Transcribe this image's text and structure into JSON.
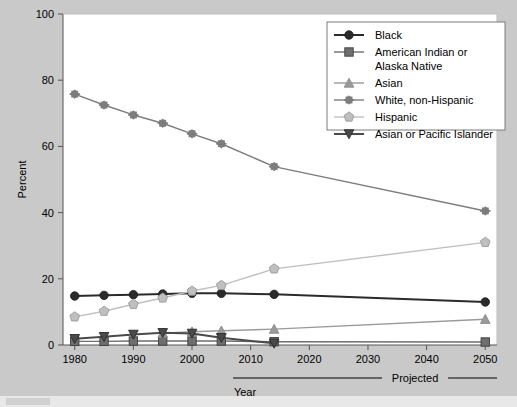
{
  "chart_data": {
    "type": "line",
    "title": "",
    "xlabel": "Year",
    "ylabel": "Percent",
    "xlim": [
      1978,
      2052
    ],
    "ylim": [
      0,
      100
    ],
    "yticks": [
      0,
      20,
      40,
      60,
      80,
      100
    ],
    "xticks": [
      1980,
      1990,
      2000,
      2010,
      2020,
      2030,
      2040,
      2050
    ],
    "xtick_labels": [
      "1980",
      "1990",
      "2000",
      "2010",
      "2020",
      "2030",
      "2040",
      "2050"
    ],
    "ytick_labels": [
      "0",
      "20",
      "40",
      "60",
      "80",
      "100"
    ],
    "grid": false,
    "legend_position": "top-right",
    "annotations": [
      {
        "text": "Projected",
        "start_x": 2007,
        "end_x": 2052
      }
    ],
    "series": [
      {
        "name": "Black",
        "color": "#2b2b2b",
        "marker": "circle",
        "x": [
          1980,
          1985,
          1990,
          1995,
          2000,
          2005,
          2014,
          2050
        ],
        "values": [
          14.8,
          15.0,
          15.2,
          15.4,
          15.6,
          15.6,
          15.3,
          13.0
        ]
      },
      {
        "name": "American Indian or Alaska Native",
        "color": "#6e6e6e",
        "marker": "square",
        "x": [
          1980,
          1985,
          1990,
          1995,
          2000,
          2005,
          2014,
          2050
        ],
        "values": [
          1.1,
          1.1,
          1.2,
          1.2,
          1.2,
          1.2,
          1.0,
          0.9
        ]
      },
      {
        "name": "Asian",
        "color": "#9a9a9a",
        "marker": "triangle-up",
        "x": [
          1995,
          2000,
          2005,
          2014,
          2050
        ],
        "values": [
          3.6,
          4.0,
          4.3,
          4.8,
          7.8
        ]
      },
      {
        "name": "White, non-Hispanic",
        "color": "#7d7d7d",
        "marker": "star-x",
        "x": [
          1980,
          1985,
          1990,
          1995,
          2000,
          2005,
          2014,
          2050
        ],
        "values": [
          75.8,
          72.5,
          69.5,
          67.0,
          63.8,
          60.8,
          53.9,
          40.5
        ]
      },
      {
        "name": "Hispanic",
        "color": "#bfbfbf",
        "marker": "pentagon",
        "x": [
          1980,
          1985,
          1990,
          1995,
          2000,
          2005,
          2014,
          2050
        ],
        "values": [
          8.5,
          10.2,
          12.3,
          14.2,
          16.3,
          18.0,
          23.0,
          31.0
        ]
      },
      {
        "name": "Asian or Pacific Islander",
        "color": "#4a4a4a",
        "marker": "triangle-down",
        "x": [
          1980,
          1985,
          1990,
          1995,
          2000,
          2005,
          2014
        ],
        "values": [
          1.9,
          2.5,
          3.2,
          3.7,
          3.5,
          2.2,
          0.5
        ]
      }
    ]
  },
  "legend": {
    "entries": [
      {
        "label": "Black",
        "marker": "circle",
        "color": "#2b2b2b"
      },
      {
        "label": "American Indian or",
        "label2": "Alaska Native",
        "marker": "square",
        "color": "#6e6e6e"
      },
      {
        "label": "Asian",
        "marker": "triangle-up",
        "color": "#9a9a9a"
      },
      {
        "label": "White, non-Hispanic",
        "marker": "star-x",
        "color": "#7d7d7d"
      },
      {
        "label": "Hispanic",
        "marker": "pentagon",
        "color": "#bfbfbf"
      },
      {
        "label": "Asian or Pacific Islander",
        "marker": "triangle-down",
        "color": "#4a4a4a"
      }
    ]
  },
  "axes": {
    "ylabel": "Percent",
    "xlabel": "Year",
    "projected_label": "Projected"
  },
  "colors": {
    "background": "#c9c9c9",
    "plot_background": "#ffffff",
    "frame": "#8a8a8a",
    "text": "#000000"
  }
}
